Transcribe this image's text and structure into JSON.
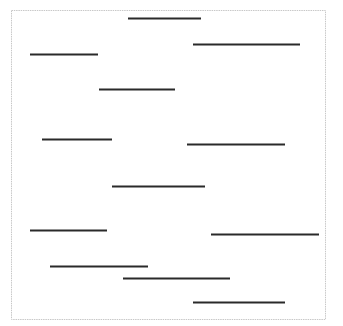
{
  "diagram": {
    "type": "horizontal-line-segments",
    "frame": {
      "x": 11,
      "y": 10,
      "width": 314,
      "height": 309,
      "stroke": "#c8c8c8"
    },
    "line_color": "#2a2a2a",
    "line_width": 2,
    "segments": [
      {
        "x1": 128,
        "x2": 201,
        "y": 18
      },
      {
        "x1": 193,
        "x2": 300,
        "y": 44
      },
      {
        "x1": 30,
        "x2": 98,
        "y": 54
      },
      {
        "x1": 99,
        "x2": 175,
        "y": 89
      },
      {
        "x1": 42,
        "x2": 112,
        "y": 139
      },
      {
        "x1": 187,
        "x2": 285,
        "y": 144
      },
      {
        "x1": 112,
        "x2": 205,
        "y": 186
      },
      {
        "x1": 30,
        "x2": 107,
        "y": 230
      },
      {
        "x1": 211,
        "x2": 319,
        "y": 234
      },
      {
        "x1": 50,
        "x2": 148,
        "y": 266
      },
      {
        "x1": 123,
        "x2": 230,
        "y": 278
      },
      {
        "x1": 193,
        "x2": 285,
        "y": 302
      }
    ]
  }
}
